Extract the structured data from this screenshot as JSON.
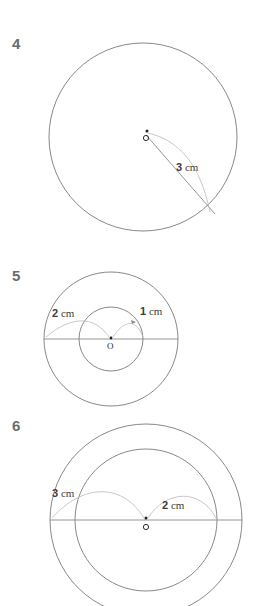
{
  "document": {
    "type": "geometry-worksheet",
    "background_color": "#ffffff",
    "line_color": "#7b7b7b",
    "leader_color": "#c2b8b8",
    "text_color": "#3c3c3c",
    "number_color": "#6b6b6b"
  },
  "figures": [
    {
      "number": "4",
      "center_label": "O",
      "labels": [
        {
          "value": "3",
          "unit": "cm",
          "text": "3 cm"
        }
      ]
    },
    {
      "number": "5",
      "center_label": "O",
      "labels": [
        {
          "value": "2",
          "unit": "cm",
          "text": "2 cm"
        },
        {
          "value": "1",
          "unit": "cm",
          "text": "1 cm"
        }
      ]
    },
    {
      "number": "6",
      "center_label": "O",
      "labels": [
        {
          "value": "3",
          "unit": "cm",
          "text": "3 cm"
        },
        {
          "value": "2",
          "unit": "cm",
          "text": "2 cm"
        }
      ]
    }
  ]
}
